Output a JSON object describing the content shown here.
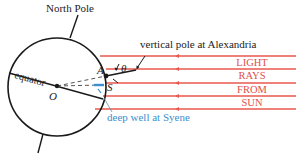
{
  "diagram": {
    "labels": {
      "north_pole": "North Pole",
      "equator": "equator",
      "center": "O",
      "point_a": "A",
      "point_s": "S",
      "theta": "θ",
      "pole_caption": "vertical pole at Alexandria",
      "well_caption": "deep well at Syene"
    },
    "sun_rays_text": [
      "LIGHT",
      "RAYS",
      "FROM",
      "SUN"
    ],
    "colors": {
      "ray": "#e8584f",
      "well": "#3b8fd0",
      "ink": "#1a1a1a"
    }
  }
}
